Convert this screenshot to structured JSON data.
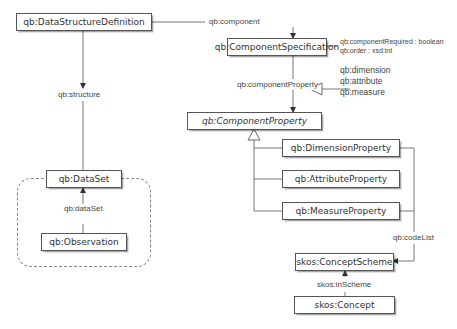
{
  "diagram": {
    "type": "uml-class-diagram",
    "nodes": {
      "dsd": "qb:DataStructureDefinition",
      "component_spec": "qb:ComponentSpecification",
      "component_property": "qb:ComponentProperty",
      "dimension_property": "qb:DimensionProperty",
      "attribute_property": "qb:AttributeProperty",
      "measure_property": "qb:MeasureProperty",
      "dataset": "qb:DataSet",
      "observation": "qb:Observation",
      "concept_scheme": "skos:ConceptScheme",
      "concept": "skos:Concept"
    },
    "edge_labels": {
      "component": "qb:component",
      "structure": "qb:structure",
      "component_property": "qb:componentProperty",
      "dataset": "qb:dataSet",
      "code_list": "qb:codeList",
      "in_scheme": "skos:inScheme"
    },
    "annotations": {
      "component_spec_attrs": [
        "qb:componentRequired : boolean",
        "qb:order : xsd:int"
      ],
      "component_property_subprops": [
        "qb:dimension",
        "qb:attribute",
        "qb:measure"
      ]
    },
    "colors": {
      "line": "#666666",
      "box_border": "#555555",
      "text": "#333333",
      "dashed_group": "#888888"
    }
  }
}
